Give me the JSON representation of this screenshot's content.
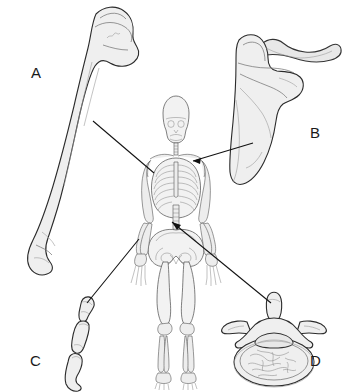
{
  "figure": {
    "background_color": "#ffffff",
    "width": 348,
    "height": 392
  },
  "labels": [
    {
      "id": "A",
      "text": "A",
      "x": 31,
      "y": 65,
      "bone": "humerus",
      "bone_class": "long bone",
      "target": "left upper arm"
    },
    {
      "id": "B",
      "text": "B",
      "x": 310,
      "y": 125,
      "bone": "scapula",
      "bone_class": "flat bone",
      "target": "right shoulder"
    },
    {
      "id": "C",
      "text": "C",
      "x": 30,
      "y": 353,
      "bone": "phalanges",
      "bone_class": "short bone",
      "target": "left hand"
    },
    {
      "id": "D",
      "text": "D",
      "x": 310,
      "y": 353,
      "bone": "vertebra",
      "bone_class": "irregular bone",
      "target": "lower spine"
    }
  ],
  "leader_lines": [
    {
      "id": "leader-a",
      "from_label": "A",
      "x1": 93,
      "y1": 121,
      "x2": 154,
      "y2": 173
    },
    {
      "id": "leader-b",
      "from_label": "B",
      "x1": 253,
      "y1": 143,
      "x2": 193,
      "y2": 161
    },
    {
      "id": "leader-c",
      "from_label": "C",
      "x1": 87,
      "y1": 303,
      "x2": 139,
      "y2": 239
    },
    {
      "id": "leader-d",
      "from_label": "D",
      "x1": 271,
      "y1": 303,
      "x2": 172,
      "y2": 222
    }
  ],
  "illustrations": [
    {
      "id": "humerus",
      "label": "A",
      "name": "humerus-illustration",
      "description": "long bone of the upper arm with rounded proximal head"
    },
    {
      "id": "scapula",
      "label": "B",
      "name": "scapula-illustration",
      "description": "flat triangular shoulder blade with clavicle"
    },
    {
      "id": "phalanx",
      "label": "C",
      "name": "phalanges-illustration",
      "description": "short bones of the finger"
    },
    {
      "id": "vertebra",
      "label": "D",
      "name": "vertebra-illustration",
      "description": "irregular bone, superior view of a lumbar vertebra"
    },
    {
      "id": "skeleton",
      "label": "",
      "name": "skeleton-illustration",
      "description": "full anterior human skeleton"
    }
  ],
  "colors": {
    "bone_fill": "#efefef",
    "bone_outline": "#2b2b2b",
    "leader_line": "#111111",
    "label_text": "#1a1a1a",
    "background": "#ffffff"
  }
}
